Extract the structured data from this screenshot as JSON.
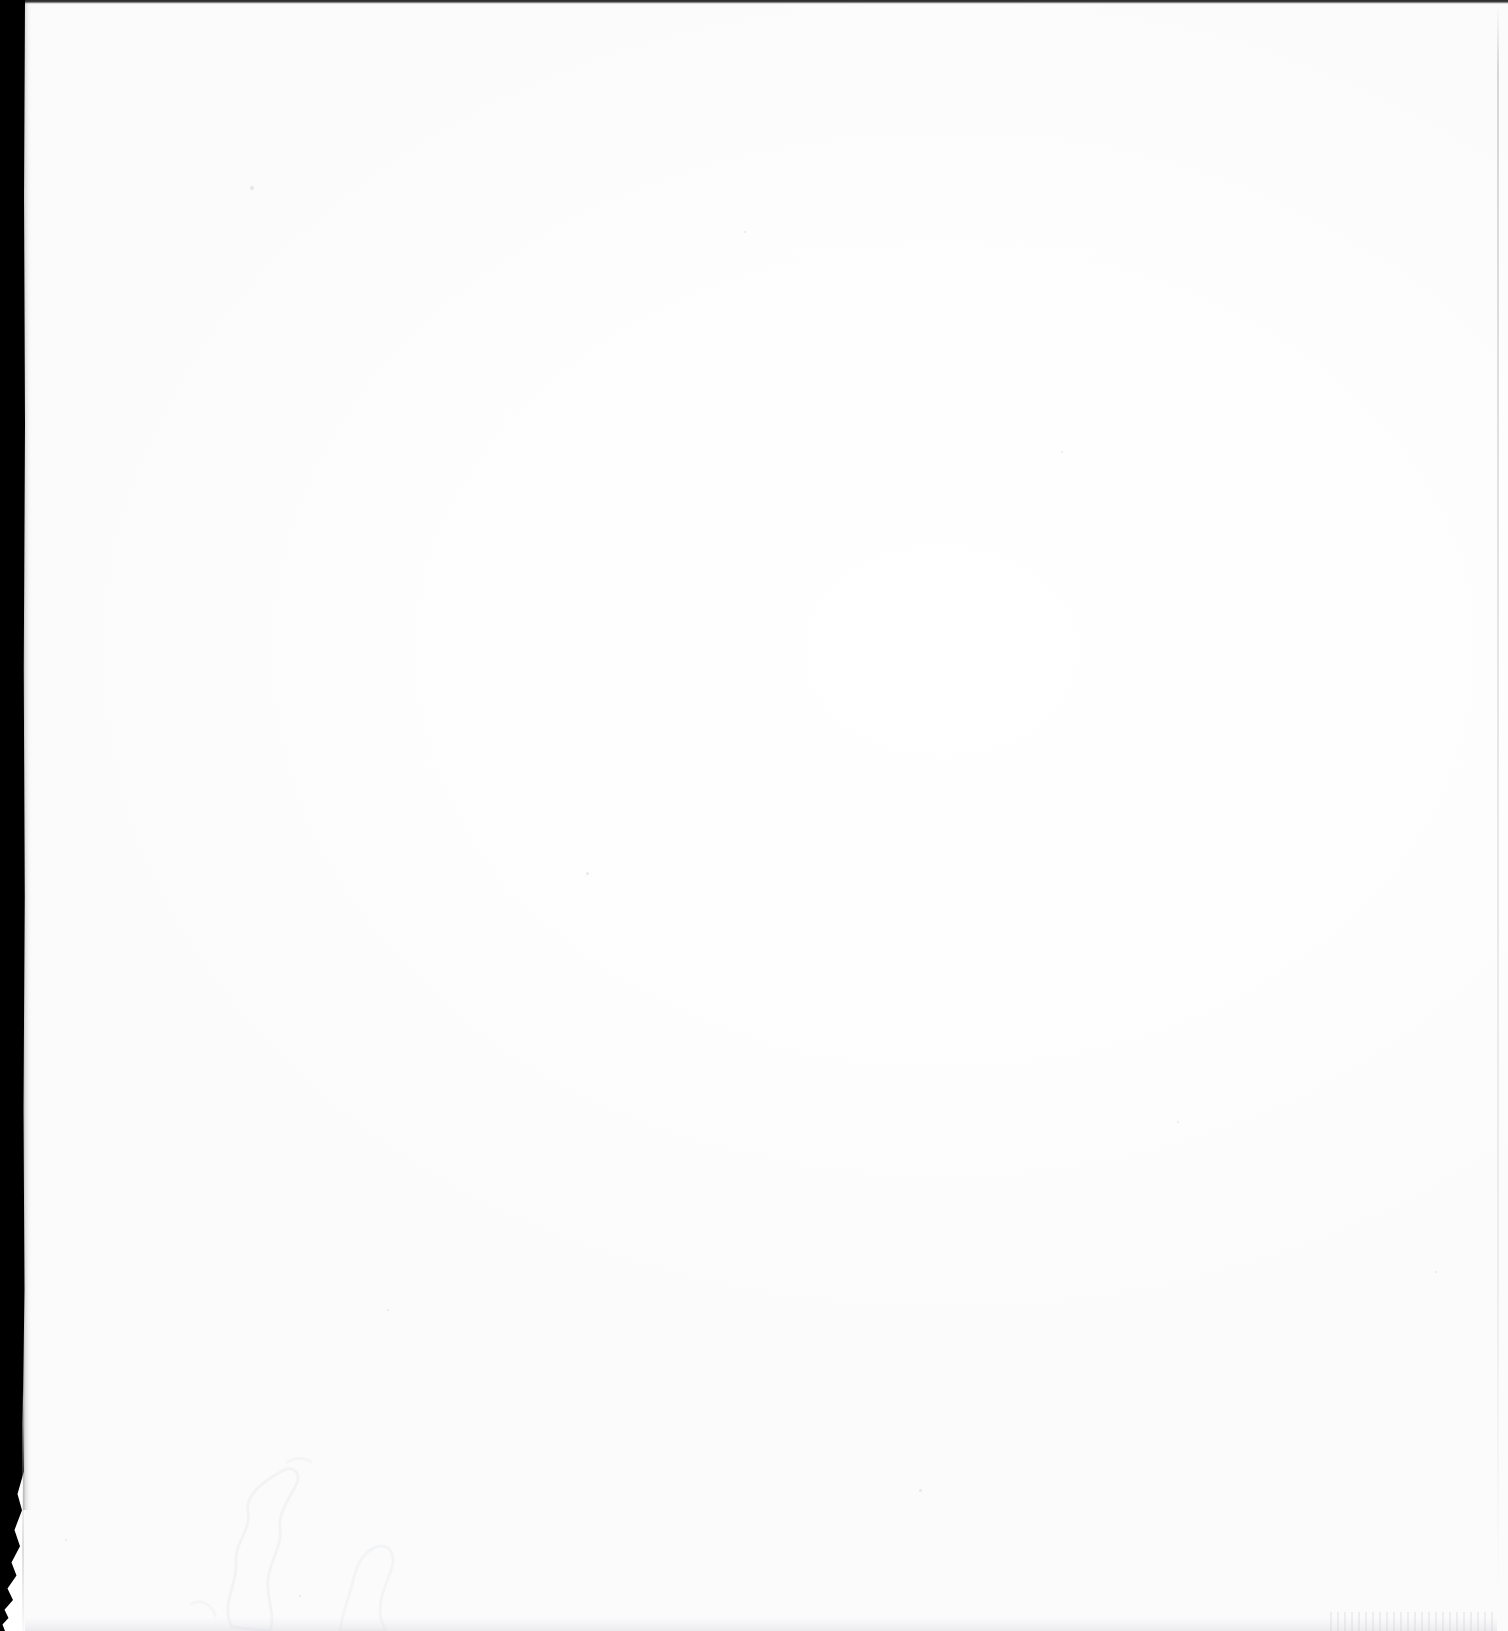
{
  "page": {
    "kind": "blank-scanned-page",
    "visible_text": "",
    "text_content_count": 0,
    "width_px": 1508,
    "height_px": 1631,
    "background_color": "#ffffff"
  },
  "artifacts": {
    "left_gutter_strip": {
      "name": "left-binding-shadow",
      "color": "#000000",
      "width_px": 25,
      "spans_full_height": true,
      "frayed_bottom": true,
      "frayed_from_y_px": 1500
    },
    "top_edge_line": {
      "name": "top-scan-edge-line",
      "color": "#2a2a2a",
      "height_px": 4,
      "spans_full_width": true
    },
    "right_edge_line": {
      "name": "right-page-edge-rule",
      "color": "#b9b9c0",
      "x_px": 1497,
      "width_px": 2
    },
    "fold_line": {
      "name": "lower-left-fold-line",
      "color": "#b2b2ba",
      "x_px": 22,
      "y_px": 1390,
      "height_px": 241
    },
    "crease_shadow": {
      "name": "lower-left-crease-shadow",
      "color": "#f3f3f5",
      "x_px": 190,
      "y_px": 1455,
      "width_px": 300,
      "height_px": 176
    },
    "bottom_speckle": {
      "name": "bottom-edge-scan-speckle",
      "color": "#e2e2e6",
      "y_px": 1617
    }
  },
  "dust_specks": [
    {
      "x": 252,
      "y": 188,
      "r": 1.6
    },
    {
      "x": 745,
      "y": 232,
      "r": 1.4
    },
    {
      "x": 1062,
      "y": 452,
      "r": 1.3
    },
    {
      "x": 587,
      "y": 873,
      "r": 1.5
    },
    {
      "x": 1178,
      "y": 1122,
      "r": 1.4
    },
    {
      "x": 388,
      "y": 1310,
      "r": 1.3
    },
    {
      "x": 920,
      "y": 1490,
      "r": 1.5
    },
    {
      "x": 1436,
      "y": 1272,
      "r": 1.3
    },
    {
      "x": 66,
      "y": 1540,
      "r": 1.4
    },
    {
      "x": 300,
      "y": 1596,
      "r": 1.3
    }
  ]
}
